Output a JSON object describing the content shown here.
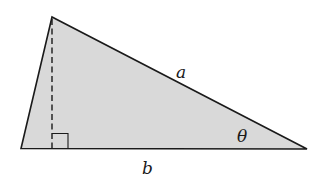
{
  "diagram": {
    "type": "triangle",
    "fill_color": "#d9d9d9",
    "stroke_color": "#1a1a1a",
    "labels": {
      "side_a": "a",
      "side_b": "b",
      "angle": "θ"
    },
    "vertices": {
      "apex": [
        52,
        17
      ],
      "bottom_left": [
        21,
        148
      ],
      "bottom_right": [
        307,
        149
      ]
    },
    "altitude": {
      "style": "dashed",
      "right_angle_marker": true
    }
  }
}
